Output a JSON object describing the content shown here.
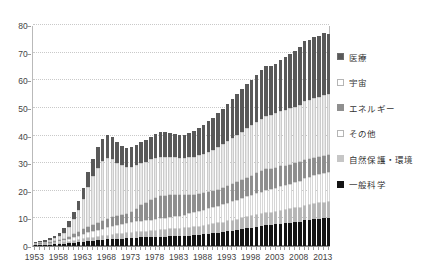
{
  "chart_data": {
    "type": "bar",
    "stacked": true,
    "title": "",
    "subtitle": "",
    "xlabel": "",
    "ylabel": "",
    "ylim": [
      0,
      80
    ],
    "yticks": [
      0,
      10,
      20,
      30,
      40,
      50,
      60,
      70,
      80
    ],
    "grid": true,
    "legend_position": "right",
    "x": [
      1953,
      1954,
      1955,
      1956,
      1957,
      1958,
      1959,
      1960,
      1961,
      1962,
      1963,
      1964,
      1965,
      1966,
      1967,
      1968,
      1969,
      1970,
      1971,
      1972,
      1973,
      1974,
      1975,
      1976,
      1977,
      1978,
      1979,
      1980,
      1981,
      1982,
      1983,
      1984,
      1985,
      1986,
      1987,
      1988,
      1989,
      1990,
      1991,
      1992,
      1993,
      1994,
      1995,
      1996,
      1997,
      1998,
      1999,
      2000,
      2001,
      2002,
      2003,
      2004,
      2005,
      2006,
      2007,
      2008,
      2009,
      2010,
      2011,
      2012,
      2013,
      2014
    ],
    "xtick_labels": [
      "1953",
      "1958",
      "1963",
      "1968",
      "1973",
      "1978",
      "1983",
      "1988",
      "1993",
      "1998",
      "2003",
      "2008",
      "2013"
    ],
    "xtick_values": [
      1953,
      1958,
      1963,
      1968,
      1973,
      1978,
      1983,
      1988,
      1993,
      1998,
      2003,
      2008,
      2013
    ],
    "series": [
      {
        "name": "一般科学",
        "color": "#141414",
        "values": [
          0.3,
          0.4,
          0.4,
          0.5,
          0.6,
          0.7,
          0.8,
          1.0,
          1.2,
          1.4,
          1.6,
          1.8,
          1.9,
          2.0,
          2.2,
          2.4,
          2.5,
          2.6,
          2.7,
          2.8,
          2.9,
          3.0,
          3.1,
          3.1,
          3.2,
          3.3,
          3.4,
          3.4,
          3.5,
          3.5,
          3.6,
          3.7,
          3.8,
          3.9,
          4.0,
          4.2,
          4.4,
          4.6,
          4.8,
          5.0,
          5.3,
          5.5,
          5.8,
          6.1,
          6.4,
          6.6,
          6.9,
          7.2,
          7.5,
          7.6,
          7.8,
          8.0,
          8.2,
          8.4,
          8.6,
          8.8,
          9.3,
          9.5,
          9.7,
          9.8,
          10.0,
          10.1
        ]
      },
      {
        "name": "自然保護・環境",
        "color": "#b7b7b7",
        "values": [
          0.2,
          0.2,
          0.3,
          0.3,
          0.4,
          0.4,
          0.5,
          0.6,
          0.7,
          0.8,
          0.9,
          1.0,
          1.1,
          1.2,
          1.3,
          1.4,
          1.5,
          1.6,
          1.7,
          1.8,
          1.9,
          2.0,
          2.1,
          2.1,
          2.2,
          2.3,
          2.4,
          2.4,
          2.5,
          2.5,
          2.6,
          2.7,
          2.8,
          2.9,
          3.0,
          3.1,
          3.2,
          3.3,
          3.4,
          3.5,
          3.6,
          3.7,
          3.8,
          3.9,
          4.0,
          4.1,
          4.2,
          4.3,
          4.4,
          4.5,
          4.6,
          4.7,
          4.8,
          4.9,
          5.0,
          5.1,
          5.3,
          5.4,
          5.5,
          5.6,
          5.7,
          5.8
        ]
      },
      {
        "name": "その他",
        "color": "#ffffff",
        "values": [
          0.2,
          0.3,
          0.3,
          0.4,
          0.5,
          0.6,
          0.8,
          1.0,
          1.3,
          1.6,
          1.9,
          2.2,
          2.4,
          2.6,
          2.8,
          3.0,
          3.2,
          3.3,
          3.5,
          3.6,
          3.8,
          3.9,
          4.0,
          4.1,
          4.2,
          4.3,
          4.4,
          4.5,
          4.6,
          4.7,
          4.8,
          5.0,
          5.2,
          5.4,
          5.6,
          5.8,
          6.0,
          6.2,
          6.4,
          6.6,
          6.8,
          7.0,
          7.2,
          7.4,
          7.6,
          7.8,
          8.0,
          8.2,
          8.4,
          8.5,
          8.7,
          8.9,
          9.1,
          9.3,
          9.5,
          9.7,
          10.0,
          10.2,
          10.4,
          10.6,
          10.8,
          11.0
        ]
      },
      {
        "name": "エネルギー",
        "color": "#8f8f8f",
        "values": [
          0.1,
          0.2,
          0.2,
          0.3,
          0.4,
          0.5,
          0.6,
          0.8,
          1.0,
          1.3,
          1.6,
          2.0,
          2.3,
          2.6,
          2.9,
          3.1,
          3.2,
          3.2,
          3.3,
          3.4,
          3.6,
          4.5,
          5.5,
          6.3,
          7.0,
          7.5,
          7.8,
          7.9,
          7.8,
          7.6,
          7.3,
          7.0,
          6.7,
          6.4,
          6.2,
          6.0,
          5.9,
          5.8,
          5.8,
          5.9,
          6.0,
          6.2,
          6.4,
          6.6,
          6.8,
          7.0,
          7.2,
          7.4,
          7.5,
          7.4,
          7.3,
          7.2,
          7.0,
          6.9,
          6.8,
          6.7,
          6.6,
          6.5,
          6.4,
          6.3,
          6.2,
          6.1
        ]
      },
      {
        "name": "宇宙",
        "color": "#e8e8e8",
        "values": [
          0.2,
          0.3,
          0.4,
          0.6,
          0.9,
          1.4,
          2.2,
          3.5,
          5.5,
          8.0,
          11.0,
          14.5,
          17.5,
          20.0,
          21.5,
          22.0,
          21.0,
          19.5,
          18.0,
          17.0,
          16.5,
          16.0,
          15.5,
          15.0,
          14.8,
          14.6,
          14.4,
          14.2,
          14.0,
          13.8,
          13.6,
          13.5,
          13.6,
          13.8,
          14.0,
          14.3,
          14.6,
          15.0,
          15.4,
          15.8,
          16.2,
          16.6,
          17.0,
          17.4,
          17.8,
          18.2,
          18.6,
          19.0,
          19.4,
          19.6,
          19.8,
          20.0,
          20.2,
          20.4,
          20.6,
          20.8,
          21.2,
          21.4,
          21.6,
          21.8,
          22.0,
          22.2
        ]
      },
      {
        "name": "医療",
        "color": "#595959",
        "values": [
          0.3,
          0.4,
          0.5,
          0.7,
          0.9,
          1.2,
          1.5,
          2.0,
          2.6,
          3.3,
          4.2,
          5.2,
          6.3,
          7.3,
          8.0,
          8.3,
          8.0,
          7.5,
          7.2,
          7.0,
          7.0,
          7.2,
          7.5,
          7.8,
          8.2,
          8.6,
          8.8,
          8.8,
          8.6,
          8.4,
          8.2,
          8.4,
          8.8,
          9.3,
          9.8,
          10.4,
          11.0,
          11.6,
          12.2,
          12.8,
          13.5,
          14.2,
          14.8,
          15.4,
          16.0,
          16.5,
          17.0,
          17.5,
          17.8,
          17.4,
          17.8,
          18.4,
          19.0,
          19.6,
          20.2,
          20.8,
          22.0,
          21.6,
          22.2,
          21.8,
          22.4,
          21.6
        ]
      }
    ]
  },
  "legend": {
    "items": [
      {
        "label": "医療",
        "color": "#595959",
        "border": "#6d6d6d"
      },
      {
        "label": "宇宙",
        "color": "#ffffff",
        "border": "#b5b5b5"
      },
      {
        "label": "エネルギー",
        "color": "#8f8f8f",
        "border": "#8f8f8f"
      },
      {
        "label": "その他",
        "color": "#ffffff",
        "border": "#b5b5b5"
      },
      {
        "label": "自然保護・環境",
        "color": "#c6c6c6",
        "border": "#c6c6c6"
      },
      {
        "label": "一般科学",
        "color": "#141414",
        "border": "#141414"
      }
    ]
  },
  "axes": {
    "y_labels": [
      "0",
      "10",
      "20",
      "30",
      "40",
      "50",
      "60",
      "70",
      "80"
    ],
    "x_labels": [
      "1953",
      "1958",
      "1963",
      "1968",
      "1973",
      "1978",
      "1983",
      "1988",
      "1993",
      "1998",
      "2003",
      "2008",
      "2013"
    ]
  }
}
